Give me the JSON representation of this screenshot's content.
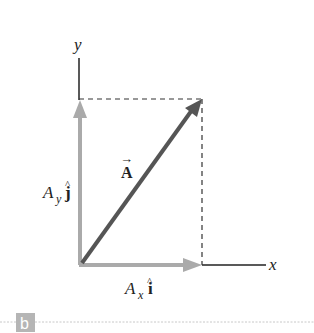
{
  "figure": {
    "panel_label": "b",
    "axes": {
      "x_label": "x",
      "y_label": "y"
    },
    "vector": {
      "name": "A",
      "arrow_symbol": "→",
      "color": "#555555"
    },
    "components": {
      "x_component": {
        "symbol": "A",
        "subscript": "x",
        "unit": "î",
        "unit_letter": "i",
        "hat": "^"
      },
      "y_component": {
        "symbol": "A",
        "subscript": "y",
        "unit": "ĵ",
        "unit_letter": "j",
        "hat": "^"
      },
      "color": "#aaaaaa"
    },
    "colors": {
      "axis": "#222222",
      "dashed": "#333333",
      "component_arrow": "#aaaaaa",
      "vector_arrow": "#555555",
      "badge_bg": "#b5b5b5",
      "badge_text": "#ffffff",
      "divider": "#c8c8c8"
    }
  }
}
